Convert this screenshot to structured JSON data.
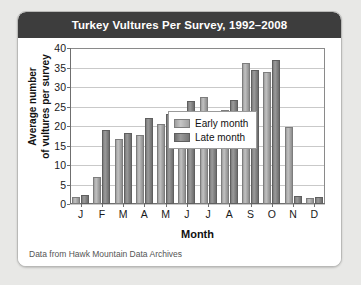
{
  "card": {
    "title": "Turkey Vultures Per Survey, 1992–2008",
    "source": "Data from Hawk Mountain Data Archives"
  },
  "legend": {
    "early_label": "Early month",
    "late_label": "Late month"
  },
  "axes": {
    "ylabel_line1": "Average number",
    "ylabel_line2": "of vultures per survey",
    "xlabel": "Month"
  },
  "chart_data": {
    "type": "bar",
    "title": "Turkey Vultures Per Survey, 1992–2008",
    "xlabel": "Month",
    "ylabel": "Average number of vultures per survey",
    "categories": [
      "J",
      "F",
      "M",
      "A",
      "M",
      "J",
      "J",
      "A",
      "S",
      "O",
      "N",
      "D"
    ],
    "category_names": [
      "January",
      "February",
      "March",
      "April",
      "May",
      "June",
      "July",
      "August",
      "September",
      "October",
      "November",
      "December"
    ],
    "series": [
      {
        "name": "Early month",
        "color": "#b0b0b0",
        "values": [
          1.3,
          6.5,
          16.1,
          17.2,
          20.1,
          21.5,
          26.9,
          23.5,
          35.6,
          33.4,
          19.2,
          1.1
        ]
      },
      {
        "name": "Late month",
        "color": "#808080",
        "values": [
          1.9,
          18.5,
          17.8,
          21.6,
          22.5,
          26.0,
          21.4,
          26.1,
          33.8,
          36.4,
          1.6,
          1.2
        ]
      }
    ],
    "ylim": [
      0,
      40
    ],
    "yticks": [
      0,
      5,
      10,
      15,
      20,
      25,
      30,
      35,
      40
    ],
    "grid": true,
    "legend_position": "upper-left-inside",
    "source_note": "Data from Hawk Mountain Data Archives"
  },
  "colors": {
    "header_bg": "#3d3d3d",
    "header_text": "#ffffff",
    "page_bg": "#e8e8e6",
    "card_bg": "#ffffff",
    "gridline": "#c9c9c9"
  }
}
